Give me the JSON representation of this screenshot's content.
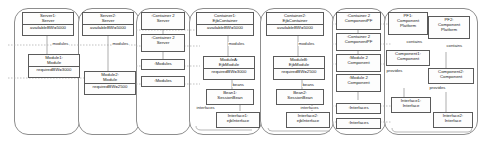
{
  "diagram": {
    "accent_border": "#8d8d8d",
    "node_border": "#5a5a5a",
    "groups": [
      {
        "name": "server-group-1"
      },
      {
        "name": "server-group-2"
      },
      {
        "name": "container-server-group"
      },
      {
        "name": "ejb-container-group-1"
      },
      {
        "name": "ejb-container-group-2"
      },
      {
        "name": "component-pf-group"
      },
      {
        "name": "platform-group"
      }
    ],
    "nodes": {
      "server1": {
        "line1": "Server1:",
        "line2": "Server",
        "attr": "availableBW=5000"
      },
      "module1": {
        "line1": "Module1:",
        "line2": "Module",
        "attr": "requiredBW=3000"
      },
      "server2": {
        "line1": "Server2:",
        "line2": "Server",
        "attr": "availableBW=5000"
      },
      "module2": {
        "line1": "Module2:",
        "line2": "Module",
        "attr": "requiredBW=2500"
      },
      "container_server_a": {
        "line1": ":Container 2",
        "line2": "Server"
      },
      "container_server_b": {
        "line1": ":Container 2",
        "line2": "Server"
      },
      "modules_box_a": {
        "line1": ":Modules"
      },
      "modules_box_b": {
        "line1": ":Modules"
      },
      "container1": {
        "line1": "Container1:",
        "line2": "EjbContainer",
        "attr": "availableBW=5000"
      },
      "moduleA": {
        "line1": "ModuleA:",
        "line2": "EjbModule",
        "attr": "requiredBW=3000"
      },
      "bean1": {
        "line1": "Bean1:",
        "line2": "SessionBean"
      },
      "interface1_ejb": {
        "line1": "Interface1:",
        "line2": "ejbInterface"
      },
      "container2": {
        "line1": "Container2:",
        "line2": "EjbContainer",
        "attr": "availableBW=5000"
      },
      "moduleB": {
        "line1": "ModuleB:",
        "line2": "EjbModule",
        "attr": "requiredBW=2500"
      },
      "bean2": {
        "line1": "Bean2:",
        "line2": "SessionBean"
      },
      "interface2_ejb": {
        "line1": "Interface2:",
        "line2": "ejbInterface"
      },
      "container_pf_a": {
        "line1": ":Container 2",
        "line2": "ComponentPF"
      },
      "container_pf_b": {
        "line1": ":Container 2",
        "line2": "ComponentPF"
      },
      "module_comp_a": {
        "line1": ":Module 2",
        "line2": "Component"
      },
      "module_comp_b": {
        "line1": ":Module 2",
        "line2": "Component"
      },
      "interfaces_a": {
        "line1": ":Interfaces"
      },
      "interfaces_b": {
        "line1": ":Interfaces"
      },
      "pf1": {
        "line1": "PF1:",
        "line2": "Component",
        "line3": "Platform"
      },
      "pf2": {
        "line1": "PF2:",
        "line2": "Component",
        "line3": "Platform"
      },
      "component1": {
        "line1": "Component1:",
        "line2": "Component"
      },
      "component2": {
        "line1": "Component2:",
        "line2": "Component"
      },
      "interface1_iface": {
        "line1": "Interface1:",
        "line2": "Interface"
      },
      "interface2_iface": {
        "line1": "Interface2:",
        "line2": "Interface"
      }
    },
    "edge_labels": {
      "modules_1": "modules",
      "modules_2": "modules",
      "modules_3": "modules",
      "modules_4": "modules",
      "beans_1": "beans",
      "beans_2": "beans",
      "interfaces_1": "interfaces",
      "interfaces_2": "interfaces",
      "contains_1": "contains",
      "contains_2": "contains",
      "provides_1": "provides",
      "provides_2": "provides"
    }
  }
}
